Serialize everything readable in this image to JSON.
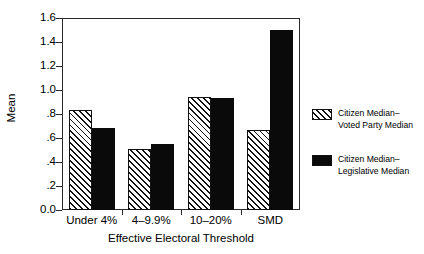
{
  "chart_data": {
    "type": "bar",
    "title": "",
    "xlabel": "Effective Electoral Threshold",
    "ylabel": "Mean",
    "categories": [
      "Under 4%",
      "4–9.9%",
      "10–20%",
      "SMD"
    ],
    "series": [
      {
        "name": "Citizen Median–\nVoted Party Median",
        "fill": "hatched",
        "values": [
          0.83,
          0.51,
          0.94,
          0.67
        ]
      },
      {
        "name": "Citizen Median–\nLegislative Median",
        "fill": "solid",
        "values": [
          0.68,
          0.55,
          0.93,
          1.5
        ]
      }
    ],
    "ylim": [
      0.0,
      1.6
    ],
    "ytick_labels": [
      "1.6",
      "1.4",
      "1.2",
      "1.0",
      ".8",
      ".6",
      ".4",
      ".2",
      "0.0"
    ],
    "ytick_values": [
      1.6,
      1.4,
      1.2,
      1.0,
      0.8,
      0.6,
      0.4,
      0.2,
      0.0
    ],
    "grid": false,
    "legend_position": "right"
  },
  "legend": {
    "entries": [
      {
        "label": "Citizen Median–\nVoted Party Median",
        "swatch": "hatched-swatch"
      },
      {
        "label": "Citizen Median–\nLegislative Median",
        "swatch": "solid-swatch"
      }
    ]
  },
  "colors": {
    "series_solid": "#0a0a0a",
    "series_hatched_line": "#111111",
    "axis": "#2a2a2a",
    "background": "#ffffff"
  }
}
